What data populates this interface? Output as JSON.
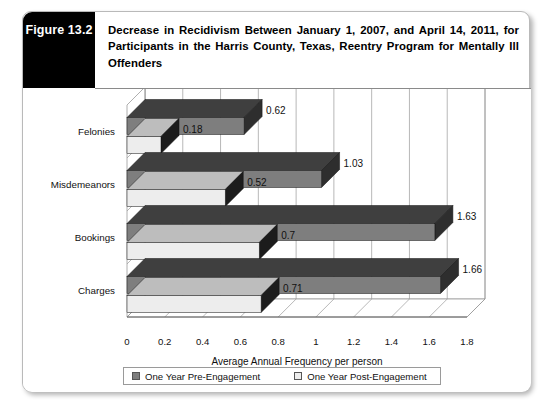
{
  "figure": {
    "number_label": "Figure 13.2",
    "title": "Decrease in Recidivism Between January 1, 2007, and April 14, 2011, for Participants in the Harris County, Texas, Reentry Program for Mentally Ill Offenders"
  },
  "legend": {
    "pre_label": "One Year Pre-Engagement",
    "post_label": "One Year Post-Engagement"
  },
  "axis": {
    "x_title": "Average Annual Frequency per person",
    "ticks": [
      "0",
      "0.2",
      "0.4",
      "0.6",
      "0.8",
      "1",
      "1.2",
      "1.4",
      "1.6",
      "1.8"
    ]
  },
  "colors": {
    "pre_front": "#7e7e7e",
    "pre_top": "#3f3f3f",
    "pre_side": "#2e2e2e",
    "post_front": "#ededed",
    "post_top": "#bdbdbd",
    "post_side": "#1c1c1c",
    "header_tab": "#000000",
    "wall": "#ffffff",
    "grid": "#9a9a9a"
  },
  "chart_data": {
    "type": "bar",
    "orientation": "horizontal",
    "title": "Decrease in Recidivism Between January 1, 2007, and April 14, 2011, for Participants in the Harris County, Texas, Reentry Program for Mentally Ill Offenders",
    "xlabel": "Average Annual Frequency per person",
    "ylabel": "",
    "xlim": [
      0,
      1.8
    ],
    "xticks": [
      0,
      0.2,
      0.4,
      0.6,
      0.8,
      1,
      1.2,
      1.4,
      1.6,
      1.8
    ],
    "grid": true,
    "legend_position": "bottom",
    "categories": [
      "Felonies",
      "Misdemeanors",
      "Bookings",
      "Charges"
    ],
    "series": [
      {
        "name": "One Year Pre-Engagement",
        "color": "#7e7e7e",
        "values": [
          0.62,
          1.03,
          1.63,
          1.66
        ],
        "labels": [
          "0.62",
          "1.03",
          "1.63",
          "1.66"
        ]
      },
      {
        "name": "One Year Post-Engagement",
        "color": "#ededed",
        "values": [
          0.18,
          0.52,
          0.7,
          0.71
        ],
        "labels": [
          "0.18",
          "0.52",
          "0.7",
          "0.71"
        ]
      }
    ]
  }
}
